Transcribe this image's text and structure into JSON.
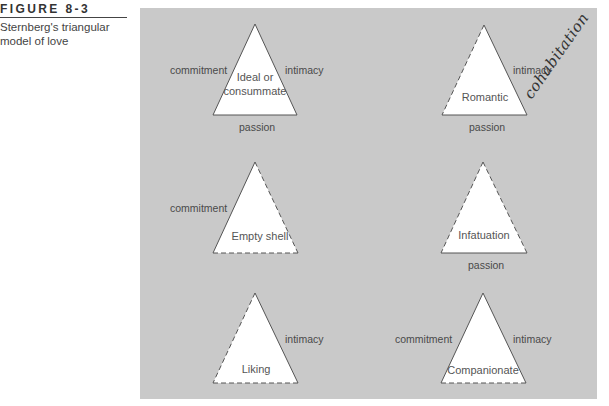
{
  "figure": {
    "label": "FIGURE 8-3",
    "caption": "Sternberg's triangular model of love"
  },
  "colors": {
    "panel_bg": "#c9c9c9",
    "triangle_fill": "#ffffff",
    "edge": "#555555",
    "text": "#4a4a4a"
  },
  "edge_labels": {
    "commitment": "commitment",
    "intimacy": "intimacy",
    "passion": "passion"
  },
  "triangles": [
    {
      "name": "Ideal or consummate",
      "line1": "Ideal or",
      "line2": "consummate",
      "commitment": true,
      "intimacy": true,
      "passion": true
    },
    {
      "name": "Romantic",
      "line1": "Romantic",
      "commitment": false,
      "intimacy": true,
      "passion": true
    },
    {
      "name": "Empty shell",
      "line1": "Empty shell",
      "commitment": true,
      "intimacy": false,
      "passion": false
    },
    {
      "name": "Infatuation",
      "line1": "Infatuation",
      "commitment": false,
      "intimacy": false,
      "passion": true
    },
    {
      "name": "Liking",
      "line1": "Liking",
      "commitment": false,
      "intimacy": true,
      "passion": false
    },
    {
      "name": "Companionate",
      "line1": "Companionate",
      "commitment": true,
      "intimacy": true,
      "passion": false
    }
  ],
  "annotation": {
    "handwritten_note": "cohabitation"
  }
}
